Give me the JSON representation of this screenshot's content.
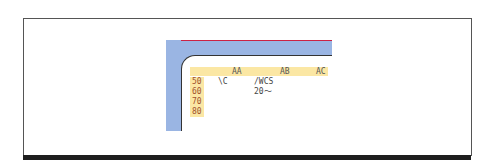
{
  "sheet": {
    "columns": [
      "AA",
      "AB",
      "AC"
    ],
    "rows": [
      {
        "label": "50",
        "cells": [
          "\\C",
          "/WCS",
          ""
        ]
      },
      {
        "label": "60",
        "cells": [
          "",
          "20～",
          ""
        ]
      },
      {
        "label": "70",
        "cells": [
          "",
          "",
          ""
        ]
      },
      {
        "label": "80",
        "cells": [
          "",
          "",
          ""
        ]
      }
    ]
  },
  "colors": {
    "frame_fill": "#9ab5e3",
    "header_fill": "#fbe7a4",
    "row_label_text": "#a0522d"
  }
}
